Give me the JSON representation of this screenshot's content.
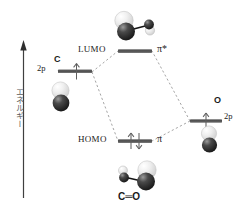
{
  "diagram": {
    "title_visible": false,
    "axis": {
      "name": "energy-axis",
      "label": "エネルギー",
      "direction": "up",
      "x": 23,
      "y_top": 43,
      "y_bottom": 198
    },
    "colors": {
      "level_line": "#4d4d4d",
      "correlation_line": "#8c8c8c",
      "text": "#1a1a1a",
      "axis": "#3a3a3a",
      "axis_label": "#5a5a5a",
      "lobe_light": "#e8e8e8",
      "lobe_dark": "#2b2b2b",
      "bond": "#111111"
    },
    "levels": [
      {
        "id": "c-2p",
        "name": "carbon-2p-level",
        "atom_label": "C",
        "orbital_label": "2p",
        "electrons": 1,
        "x1": 58,
        "x2": 92,
        "y": 72
      },
      {
        "id": "o-2p",
        "name": "oxygen-2p-level",
        "atom_label": "O",
        "orbital_label": "2p",
        "electrons": 1,
        "x1": 190,
        "x2": 222,
        "y": 121
      },
      {
        "id": "lumo",
        "name": "lumo-level",
        "left_label": "LUMO",
        "right_label": "π*",
        "electrons": 0,
        "x1": 118,
        "x2": 152,
        "y": 51
      },
      {
        "id": "homo",
        "name": "homo-level",
        "left_label": "HOMO",
        "right_label": "π",
        "electrons": 2,
        "x1": 118,
        "x2": 152,
        "y": 141
      }
    ],
    "correlation_lines": [
      {
        "name": "c2p-to-lumo",
        "x1": 92,
        "y1": 72,
        "x2": 118,
        "y2": 51
      },
      {
        "name": "c2p-to-homo",
        "x1": 92,
        "y1": 72,
        "x2": 118,
        "y2": 141
      },
      {
        "name": "o2p-to-lumo",
        "x1": 190,
        "y1": 121,
        "x2": 152,
        "y2": 51
      },
      {
        "name": "o2p-to-homo",
        "x1": 190,
        "y1": 121,
        "x2": 152,
        "y2": 141
      }
    ],
    "orbital_pictures": [
      {
        "id": "pi-star-orbital",
        "name": "pi-antibonding-orbital-picture",
        "caption": "",
        "description": "antibonding pi* orbital of CO"
      },
      {
        "id": "pi-orbital",
        "name": "pi-bonding-orbital-picture",
        "caption": "C=O",
        "description": "bonding pi orbital of CO"
      },
      {
        "id": "c-p-orbital",
        "name": "carbon-p-orbital-picture",
        "caption": "",
        "description": "carbon 2p atomic orbital"
      },
      {
        "id": "o-p-orbital",
        "name": "oxygen-p-orbital-picture",
        "caption": "",
        "description": "oxygen 2p atomic orbital"
      }
    ],
    "molecule_label": "C=O",
    "molecule_label_text": "C═O"
  }
}
